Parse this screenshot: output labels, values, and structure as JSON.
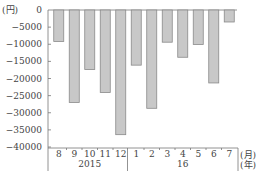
{
  "chart_data": {
    "type": "bar",
    "title": "",
    "ylabel": "(円)",
    "xlabel": "(月)(年)",
    "x_unit_month": "(月)",
    "x_unit_year": "(年)",
    "y_unit": "(円)",
    "ylim": [
      -40000,
      0
    ],
    "yticks": [
      0,
      -5000,
      -10000,
      -15000,
      -20000,
      -25000,
      -30000,
      -35000,
      -40000
    ],
    "ytick_labels": [
      "0",
      "-5000",
      "-10000",
      "-15000",
      "-20000",
      "-25000",
      "-30000",
      "-35000",
      "-40000"
    ],
    "categories": [
      "8",
      "9",
      "10",
      "11",
      "12",
      "1",
      "2",
      "3",
      "4",
      "5",
      "6",
      "7"
    ],
    "year_groups": [
      {
        "label": "2015",
        "months": [
          "8",
          "9",
          "10",
          "11",
          "12"
        ]
      },
      {
        "label": "16",
        "months": [
          "1",
          "2",
          "3",
          "4",
          "5",
          "6",
          "7"
        ]
      }
    ],
    "values": [
      -9200,
      -27000,
      -17400,
      -24100,
      -36400,
      -16100,
      -28700,
      -9400,
      -13800,
      -10100,
      -21300,
      -3500
    ],
    "grid": false,
    "legend": null
  }
}
